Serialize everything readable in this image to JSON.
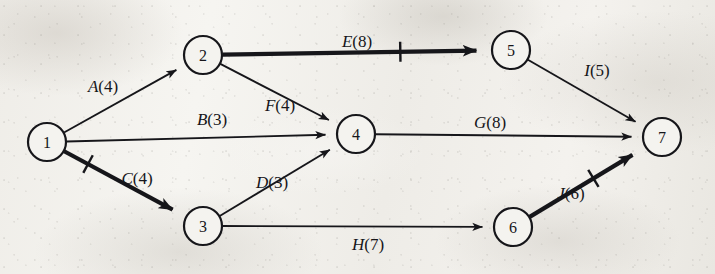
{
  "diagram": {
    "background_color": "#f2f0ec",
    "ink_color": "#16161a",
    "nodes": [
      {
        "id": "1",
        "label": "1",
        "cx": 47,
        "cy": 142,
        "r": 19
      },
      {
        "id": "2",
        "label": "2",
        "cx": 203,
        "cy": 55,
        "r": 19
      },
      {
        "id": "3",
        "label": "3",
        "cx": 203,
        "cy": 226,
        "r": 19
      },
      {
        "id": "4",
        "label": "4",
        "cx": 356,
        "cy": 134,
        "r": 19
      },
      {
        "id": "5",
        "label": "5",
        "cx": 511,
        "cy": 50,
        "r": 19
      },
      {
        "id": "6",
        "label": "6",
        "cx": 513,
        "cy": 227,
        "r": 19
      },
      {
        "id": "7",
        "label": "7",
        "cx": 662,
        "cy": 137,
        "r": 19
      }
    ],
    "edges": [
      {
        "id": "A",
        "activity": "A",
        "duration": 4,
        "label": "A(4)",
        "from": "1",
        "to": "2",
        "label_x": 103,
        "label_y": 86,
        "bold": false,
        "tick": false
      },
      {
        "id": "B",
        "activity": "B",
        "duration": 3,
        "label": "B(3)",
        "from": "1",
        "to": "4",
        "label_x": 212,
        "label_y": 119,
        "bold": false,
        "tick": false
      },
      {
        "id": "C",
        "activity": "C",
        "duration": 4,
        "label": "C(4)",
        "from": "1",
        "to": "3",
        "label_x": 137,
        "label_y": 178,
        "bold": true,
        "tick": true,
        "tick_t": 0.22
      },
      {
        "id": "D",
        "activity": "D",
        "duration": 3,
        "label": "D(3)",
        "from": "3",
        "to": "4",
        "label_x": 272,
        "label_y": 182,
        "bold": false,
        "tick": false
      },
      {
        "id": "E",
        "activity": "E",
        "duration": 8,
        "label": "E(8)",
        "from": "2",
        "to": "5",
        "label_x": 357,
        "label_y": 41,
        "bold": true,
        "tick": true,
        "tick_t": 0.7
      },
      {
        "id": "F",
        "activity": "F",
        "duration": 4,
        "label": "F(4)",
        "from": "2",
        "to": "4",
        "label_x": 280,
        "label_y": 105,
        "bold": false,
        "tick": false
      },
      {
        "id": "G",
        "activity": "G",
        "duration": 8,
        "label": "G(8)",
        "from": "4",
        "to": "7",
        "label_x": 490,
        "label_y": 122,
        "bold": false,
        "tick": false
      },
      {
        "id": "H",
        "activity": "H",
        "duration": 7,
        "label": "H(7)",
        "from": "3",
        "to": "6",
        "label_x": 368,
        "label_y": 244,
        "bold": false,
        "tick": false
      },
      {
        "id": "I",
        "activity": "I",
        "duration": 5,
        "label": "I(5)",
        "from": "5",
        "to": "7",
        "label_x": 597,
        "label_y": 70,
        "bold": false,
        "tick": false
      },
      {
        "id": "J",
        "activity": "J",
        "duration": 6,
        "label": "J(6)",
        "from": "6",
        "to": "7",
        "label_x": 571,
        "label_y": 193,
        "bold": true,
        "tick": true,
        "tick_t": 0.62
      }
    ],
    "critical_path_edges": [
      "C",
      "E",
      "J"
    ],
    "node_labels": {
      "n1": "1",
      "n2": "2",
      "n3": "3",
      "n4": "4",
      "n5": "5",
      "n6": "6",
      "n7": "7"
    },
    "edge_labels": {
      "A": "A(4)",
      "B": "B(3)",
      "C": "C(4)",
      "D": "D(3)",
      "E": "E(8)",
      "F": "F(4)",
      "G": "G(8)",
      "H": "H(7)",
      "I": "I(5)",
      "J": "J(6)"
    }
  }
}
